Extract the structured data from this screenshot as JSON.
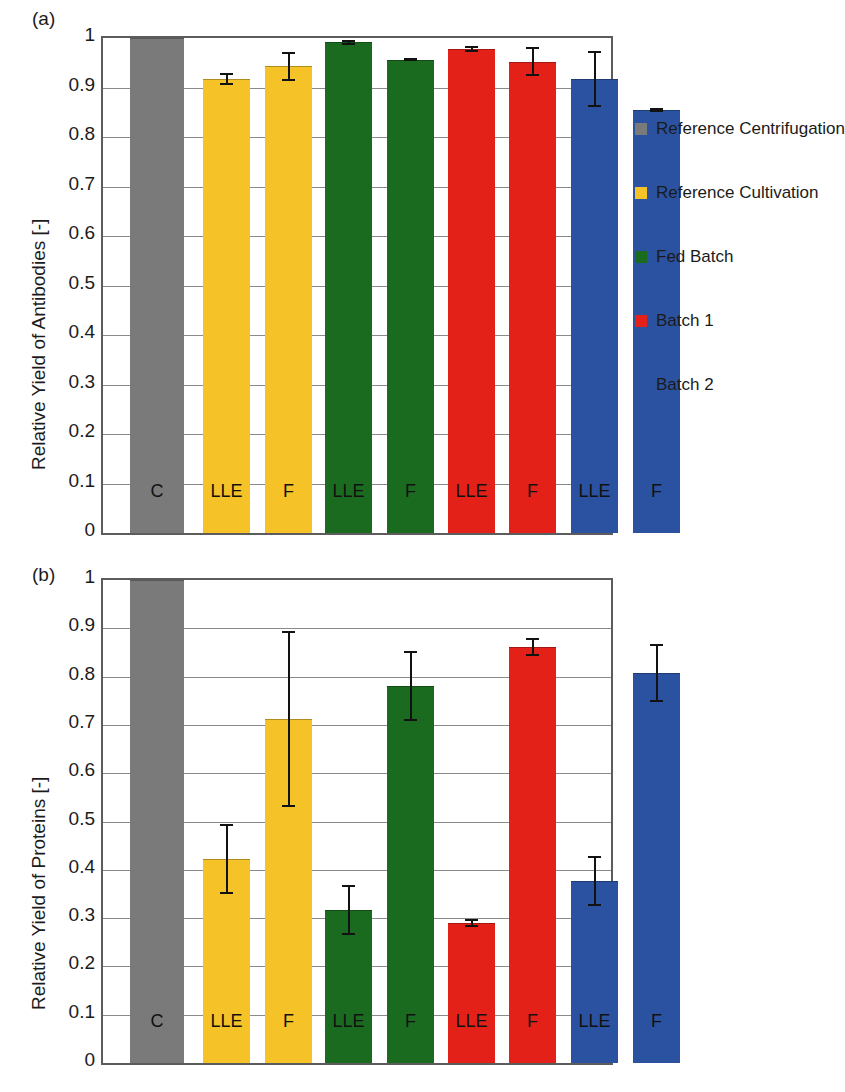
{
  "figure": {
    "panels": [
      {
        "tag": "(a)",
        "ylabel": "Relative Yield of Antibodies [-]",
        "yticks": [
          "1",
          "0.9",
          "0.8",
          "0.7",
          "0.6",
          "0.5",
          "0.4",
          "0.3",
          "0.2",
          "0.1",
          "0"
        ]
      },
      {
        "tag": "(b)",
        "ylabel": "Relative Yield of Proteins [-]",
        "yticks": [
          "1",
          "0.9",
          "0.8",
          "0.7",
          "0.6",
          "0.5",
          "0.4",
          "0.3",
          "0.2",
          "0.1",
          "0"
        ]
      }
    ]
  },
  "legend": {
    "items": [
      {
        "label": "Reference Centrifugation",
        "color": "#7a7a7a"
      },
      {
        "label": "Reference Cultivation",
        "color": "#F5C327"
      },
      {
        "label": "Fed Batch",
        "color": "#1A6B1F"
      },
      {
        "label": "Batch 1",
        "color": "#E32119"
      },
      {
        "label": "Batch 2",
        "color": "#2B52A0"
      }
    ]
  },
  "chart_data": [
    {
      "type": "bar",
      "title": "(a)",
      "xlabel": "",
      "ylabel": "Relative Yield of Antibodies [-]",
      "ylim": [
        0,
        1
      ],
      "grid": true,
      "legend_position": "right",
      "categories": [
        "C",
        "LLE",
        "F",
        "LLE",
        "F",
        "LLE",
        "F",
        "LLE",
        "F"
      ],
      "groups": [
        "Reference Centrifugation",
        "Reference Cultivation",
        "Reference Cultivation",
        "Fed Batch",
        "Fed Batch",
        "Batch 1",
        "Batch 1",
        "Batch 2",
        "Batch 2"
      ],
      "colors": [
        "#7a7a7a",
        "#F5C327",
        "#F5C327",
        "#1A6B1F",
        "#1A6B1F",
        "#E32119",
        "#E32119",
        "#2B52A0",
        "#2B52A0"
      ],
      "values": [
        1.0,
        0.918,
        0.943,
        0.991,
        0.956,
        0.978,
        0.952,
        0.917,
        0.855
      ],
      "errors": [
        0.0,
        0.012,
        0.029,
        0.005,
        0.003,
        0.006,
        0.029,
        0.057,
        0.004
      ]
    },
    {
      "type": "bar",
      "title": "(b)",
      "xlabel": "",
      "ylabel": "Relative Yield of Proteins [-]",
      "ylim": [
        0,
        1
      ],
      "grid": true,
      "legend_position": "right",
      "categories": [
        "C",
        "LLE",
        "F",
        "LLE",
        "F",
        "LLE",
        "F",
        "LLE",
        "F"
      ],
      "groups": [
        "Reference Centrifugation",
        "Reference Cultivation",
        "Reference Cultivation",
        "Fed Batch",
        "Fed Batch",
        "Batch 1",
        "Batch 1",
        "Batch 2",
        "Batch 2"
      ],
      "colors": [
        "#7a7a7a",
        "#F5C327",
        "#F5C327",
        "#1A6B1F",
        "#1A6B1F",
        "#E32119",
        "#E32119",
        "#2B52A0",
        "#2B52A0"
      ],
      "values": [
        1.0,
        0.422,
        0.712,
        0.317,
        0.78,
        0.29,
        0.861,
        0.376,
        0.808
      ],
      "errors": [
        0.0,
        0.072,
        0.182,
        0.052,
        0.072,
        0.008,
        0.018,
        0.052,
        0.06
      ]
    }
  ]
}
